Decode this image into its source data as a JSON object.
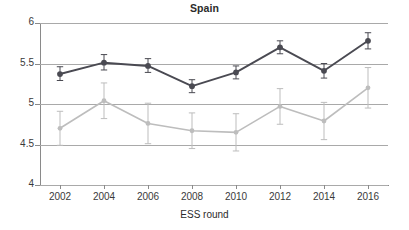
{
  "chart_data": {
    "type": "line",
    "title": "Spain",
    "xlabel": "ESS round",
    "ylabel": "",
    "x": [
      2002,
      2004,
      2006,
      2008,
      2010,
      2012,
      2014,
      2016
    ],
    "xtick_labels": [
      "2002",
      "2004",
      "2006",
      "2008",
      "2010",
      "2012",
      "2014",
      "2016"
    ],
    "ytick_labels": [
      "6",
      "5.5",
      "5",
      "4.5",
      "4"
    ],
    "ytick_values": [
      6,
      5.5,
      5,
      4.5,
      4
    ],
    "ylim": [
      4,
      6
    ],
    "grid": true,
    "legend": "none",
    "series": [
      {
        "name": "dark-series",
        "color": "#4a4a52",
        "values": [
          5.37,
          5.51,
          5.47,
          5.22,
          5.39,
          5.7,
          5.41,
          5.78
        ],
        "err_low": [
          5.29,
          5.42,
          5.39,
          5.14,
          5.31,
          5.62,
          5.32,
          5.68
        ],
        "err_high": [
          5.46,
          5.61,
          5.56,
          5.3,
          5.47,
          5.78,
          5.5,
          5.88
        ]
      },
      {
        "name": "light-series",
        "color": "#bdbdbd",
        "values": [
          4.7,
          5.04,
          4.76,
          4.67,
          4.65,
          4.97,
          4.79,
          5.2
        ],
        "err_low": [
          4.49,
          4.82,
          4.51,
          4.45,
          4.42,
          4.75,
          4.56,
          4.95
        ],
        "err_high": [
          4.91,
          5.26,
          5.01,
          4.89,
          4.88,
          5.19,
          5.02,
          5.45
        ]
      }
    ]
  }
}
